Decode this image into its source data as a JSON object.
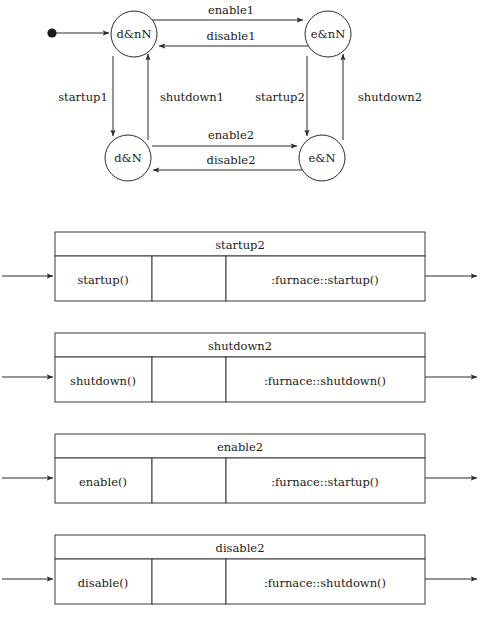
{
  "diagram": {
    "type": "uml-state-machine",
    "initial_pseudostate": {
      "name": "initial-dot",
      "target": "d&nN"
    },
    "states": [
      {
        "id": "d_nN",
        "label": "d&nN",
        "cx": 134,
        "cy": 34,
        "r": 23
      },
      {
        "id": "e_nN",
        "label": "e&nN",
        "cx": 328,
        "cy": 34,
        "r": 23
      },
      {
        "id": "d_N",
        "label": "d&N",
        "cx": 128,
        "cy": 158,
        "r": 23
      },
      {
        "id": "e_N",
        "label": "e&N",
        "cx": 322,
        "cy": 158,
        "r": 23
      }
    ],
    "transitions": [
      {
        "label": "enable1",
        "from": "d&nN",
        "to": "e&nN",
        "orientation": "horizontal",
        "label_x": 231,
        "label_y": 14
      },
      {
        "label": "disable1",
        "from": "e&nN",
        "to": "d&nN",
        "orientation": "horizontal",
        "label_x": 231,
        "label_y": 39
      },
      {
        "label": "startup1",
        "from": "d&nN",
        "to": "d&N",
        "orientation": "vertical",
        "label_x": 83,
        "label_y": 101
      },
      {
        "label": "shutdown1",
        "from": "d&N",
        "to": "d&nN",
        "orientation": "vertical",
        "label_x": 192,
        "label_y": 101
      },
      {
        "label": "startup2",
        "from": "e&nN",
        "to": "e&N",
        "orientation": "vertical",
        "label_x": 280,
        "label_y": 101
      },
      {
        "label": "shutdown2",
        "from": "e&N",
        "to": "e&nN",
        "orientation": "vertical",
        "label_x": 390,
        "label_y": 101
      },
      {
        "label": "enable2",
        "from": "d&N",
        "to": "e&N",
        "orientation": "horizontal",
        "label_x": 231,
        "label_y": 139
      },
      {
        "label": "disable2",
        "from": "e&N",
        "to": "d&N",
        "orientation": "horizontal",
        "label_x": 231,
        "label_y": 163
      }
    ]
  },
  "tables": [
    {
      "title": "startup2",
      "cells": [
        "startup()",
        "",
        ":furnace::startup()"
      ],
      "top": 232
    },
    {
      "title": "shutdown2",
      "cells": [
        "shutdown()",
        "",
        ":furnace::shutdown()"
      ],
      "top": 333
    },
    {
      "title": "enable2",
      "cells": [
        "enable()",
        "",
        ":furnace::startup()"
      ],
      "top": 434
    },
    {
      "title": "disable2",
      "cells": [
        "disable()",
        "",
        ":furnace::shutdown()"
      ],
      "top": 535
    }
  ],
  "colors": {
    "line": "#2b2b2b",
    "table_line": "#3a3a3a",
    "text": "#1a1a1a",
    "background": "#ffffff"
  }
}
